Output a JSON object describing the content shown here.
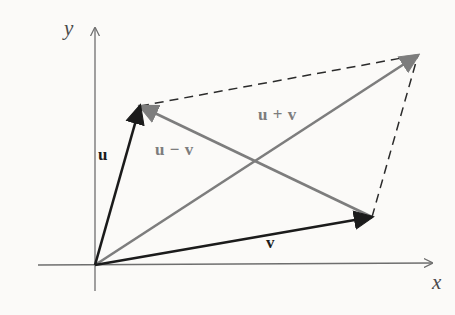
{
  "figure": {
    "background_color": "#fbfaf8",
    "width": 455,
    "height": 315
  },
  "colors": {
    "axis": "#6e6e6e",
    "vector_dark": "#1b1b1b",
    "vector_gray": "#7d7d7d",
    "dashed": "#2b2b2b",
    "label_axis": "#4a4a4a"
  },
  "axes": {
    "origin": {
      "x": 95,
      "y": 265
    },
    "x_axis": {
      "label": "x",
      "label_pos": {
        "x": 432,
        "y": 272
      },
      "start": {
        "x": 38,
        "y": 265
      },
      "end": {
        "x": 432,
        "y": 263
      },
      "arrow": true
    },
    "y_axis": {
      "label": "y",
      "label_pos": {
        "x": 64,
        "y": 18
      },
      "start": {
        "x": 95,
        "y": 291
      },
      "end": {
        "x": 95,
        "y": 28
      },
      "arrow": true
    }
  },
  "vectors": [
    {
      "name": "u",
      "label": "u",
      "label_pos": {
        "x": 98,
        "y": 146
      },
      "color": "#1b1b1b",
      "style": "solid",
      "width": 2.6,
      "arrow": true,
      "from": {
        "x": 95,
        "y": 265
      },
      "to": {
        "x": 140,
        "y": 106
      }
    },
    {
      "name": "v",
      "label": "v",
      "label_pos": {
        "x": 266,
        "y": 234
      },
      "color": "#1b1b1b",
      "style": "solid",
      "width": 2.6,
      "arrow": true,
      "from": {
        "x": 95,
        "y": 265
      },
      "to": {
        "x": 372,
        "y": 217
      }
    },
    {
      "name": "u-plus-v",
      "label": "u + v",
      "label_pos": {
        "x": 258,
        "y": 106
      },
      "color": "#7d7d7d",
      "style": "solid",
      "width": 2.6,
      "arrow": true,
      "from": {
        "x": 95,
        "y": 265
      },
      "to": {
        "x": 418,
        "y": 55
      }
    },
    {
      "name": "u-minus-v",
      "label": "u − v",
      "label_pos": {
        "x": 155,
        "y": 141
      },
      "color": "#7d7d7d",
      "style": "solid",
      "width": 2.6,
      "arrow": true,
      "from": {
        "x": 372,
        "y": 217
      },
      "to": {
        "x": 140,
        "y": 106
      }
    }
  ],
  "dashed_edges": [
    {
      "name": "u-to-sum",
      "from": {
        "x": 140,
        "y": 106
      },
      "to": {
        "x": 418,
        "y": 55
      },
      "dash": "9 6"
    },
    {
      "name": "v-to-sum",
      "from": {
        "x": 372,
        "y": 217
      },
      "to": {
        "x": 418,
        "y": 55
      },
      "dash": "9 6"
    }
  ],
  "diagram_data": {
    "type": "vector-diagram",
    "description": "Parallelogram law: vectors u and v drawn from the origin, their sum u+v as the diagonal to the opposite corner, and their difference u-v drawn from the tip of v to the tip of u.",
    "labels": [
      "u",
      "v",
      "u + v",
      "u − v",
      "x",
      "y"
    ]
  }
}
